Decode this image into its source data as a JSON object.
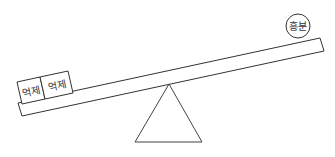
{
  "diagram": {
    "type": "seesaw",
    "left_side": {
      "boxes": [
        {
          "label": "억제"
        },
        {
          "label": "억제"
        }
      ]
    },
    "right_side": {
      "circle": {
        "label": "흥분"
      }
    },
    "colors": {
      "stroke": "#333333",
      "background": "#ffffff"
    }
  }
}
